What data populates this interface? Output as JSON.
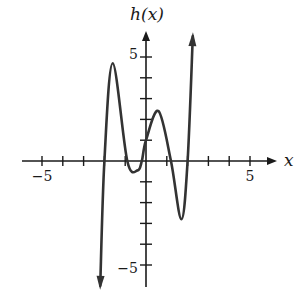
{
  "chart_data": {
    "type": "line",
    "title": "",
    "xlabel": "x",
    "ylabel": "h(x)",
    "xlim": [
      -6,
      6
    ],
    "ylim": [
      -6,
      6
    ],
    "x_tick_labels": [
      "-5",
      "5"
    ],
    "y_tick_labels": [
      "5",
      "-5"
    ],
    "tick_spacing": 1,
    "grid": false,
    "series": [
      {
        "name": "h(x)",
        "points": [
          [
            -2.2,
            -6.0
          ],
          [
            -2.0,
            0.0
          ],
          [
            -1.6,
            4.7
          ],
          [
            -0.9,
            0.0
          ],
          [
            -0.4,
            -0.45
          ],
          [
            -0.2,
            0.0
          ],
          [
            0.0,
            1.0
          ],
          [
            0.6,
            2.4
          ],
          [
            1.2,
            0.0
          ],
          [
            1.7,
            -2.8
          ],
          [
            2.0,
            0.0
          ],
          [
            2.25,
            6.0
          ]
        ],
        "end_arrows": true
      }
    ],
    "zeros": [
      -2.0,
      -0.9,
      -0.2,
      1.2,
      2.0
    ],
    "local_max": [
      [
        -1.6,
        4.7
      ],
      [
        0.6,
        2.4
      ]
    ],
    "local_min": [
      [
        -0.4,
        -0.45
      ],
      [
        1.7,
        -2.8
      ]
    ],
    "y_intercept": 1.0
  },
  "labels": {
    "y_axis": "h(x)",
    "x_axis": "x",
    "x_neg5": "−5",
    "x_pos5": "5",
    "y_pos5": "5",
    "y_neg5": "−5"
  },
  "colors": {
    "axis": "#1a1a1a",
    "curve": "#333333"
  }
}
